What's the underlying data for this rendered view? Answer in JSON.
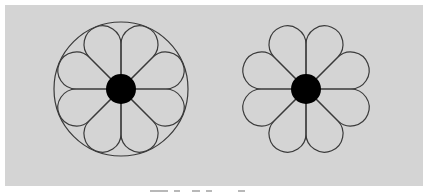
{
  "figure": {
    "background_color": "#d4d4d4",
    "stroke_color": "#3a3a3a",
    "fill_center_color": "#000000",
    "petal_count": 8,
    "flowers": [
      {
        "id": "left",
        "center": [
          121,
          89
        ],
        "center_disc_radius": 15,
        "petal_circle_distance": 48.4,
        "petal_radius": 18.5,
        "enclosing_circle": true,
        "enclosing_circle_radius": 67
      },
      {
        "id": "right",
        "center": [
          306,
          89
        ],
        "center_disc_radius": 15,
        "petal_circle_distance": 48.4,
        "petal_radius": 18.5,
        "enclosing_circle": false
      }
    ]
  },
  "caption": {
    "text": ""
  }
}
